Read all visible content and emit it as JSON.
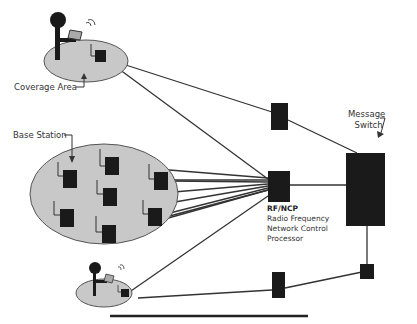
{
  "labels": {
    "coverage_area": "Coverage Area",
    "base_station": "Base Station",
    "message_switch_line1": "Message",
    "message_switch_line2": "Switch",
    "rfncp": "RF/NCP",
    "rfncp_desc1": "Radio Frequency",
    "rfncp_desc2": "Network Control",
    "rfncp_desc3": "Processor"
  },
  "colors": {
    "ellipse_fill": "#c8c8c8",
    "ellipse_stroke": "#555555",
    "node_fill": "#1a1a1a",
    "line": "#333333"
  },
  "nodes": {
    "base_stations_large_area": 7,
    "relay_nodes": 2,
    "coverage_areas": 3
  }
}
